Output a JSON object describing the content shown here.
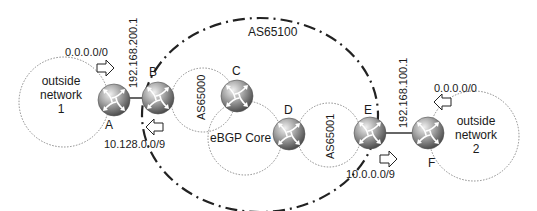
{
  "diagram": {
    "colors": {
      "router_light": "#e6e6e6",
      "router_mid": "#9a9a9a",
      "router_dark": "#4a4a4a",
      "line": "#333333",
      "dotted": "#8a8a8a",
      "dashdot": "#222222"
    },
    "as_boundary": {
      "label": "AS65100"
    },
    "clouds": [
      {
        "id": "outside1",
        "lines": [
          "outside",
          "network",
          "1"
        ]
      },
      {
        "id": "as65000",
        "label": "AS65000"
      },
      {
        "id": "ebgp",
        "label": "eBGP Core"
      },
      {
        "id": "as65001",
        "label": "AS65001"
      },
      {
        "id": "outside2",
        "lines": [
          "outside",
          "network",
          "2"
        ]
      }
    ],
    "routers": [
      {
        "id": "A",
        "label": "A"
      },
      {
        "id": "B",
        "label": "B"
      },
      {
        "id": "C",
        "label": "C"
      },
      {
        "id": "D",
        "label": "D"
      },
      {
        "id": "E",
        "label": "E"
      },
      {
        "id": "F",
        "label": "F"
      }
    ],
    "links": [
      {
        "from": "A",
        "to": "B",
        "address": "192.168.200.1"
      },
      {
        "from": "E",
        "to": "F",
        "address": "192.168.100.1"
      }
    ],
    "route_advertisements": [
      {
        "near": "A",
        "prefix": "0.0.0.0/0",
        "direction": "right"
      },
      {
        "near": "B",
        "prefix": "10.128.0.0/9",
        "direction": "left"
      },
      {
        "near": "E",
        "prefix": "10.0.0.0/9",
        "direction": "right"
      },
      {
        "near": "F",
        "prefix": "0.0.0.0/0",
        "direction": "left"
      }
    ]
  }
}
